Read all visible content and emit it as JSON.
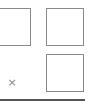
{
  "tiles": [
    {
      "id": "left",
      "content": ""
    },
    {
      "id": "right-top",
      "content": ""
    },
    {
      "id": "right-bottom",
      "content": ""
    }
  ],
  "close": {
    "glyph": "×",
    "icon": "close-icon"
  },
  "colors": {
    "tile_border": "#8a8a8a",
    "rule": "#555555",
    "background": "#ffffff"
  }
}
